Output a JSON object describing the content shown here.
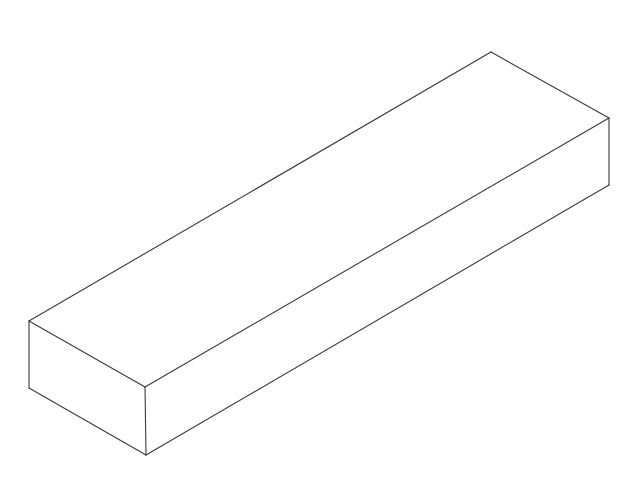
{
  "diagram": {
    "type": "isometric-box",
    "background": "#ffffff",
    "stroke_color": "#3a3a3a",
    "vertices": {
      "top_back": [
        491,
        52
      ],
      "right_top": [
        609,
        118
      ],
      "right_bottom": [
        609,
        185
      ],
      "left_top": [
        29,
        321
      ],
      "left_bottom": [
        29,
        388
      ],
      "front_top": [
        145,
        387
      ],
      "front_bottom": [
        146,
        455
      ]
    },
    "edges": [
      {
        "name": "top-back-left-edge",
        "from": "left_top",
        "to": "top_back"
      },
      {
        "name": "top-back-right-edge",
        "from": "top_back",
        "to": "right_top"
      },
      {
        "name": "top-front-right-edge",
        "from": "front_top",
        "to": "right_top"
      },
      {
        "name": "top-front-left-edge",
        "from": "left_top",
        "to": "front_top"
      },
      {
        "name": "left-vertical-edge",
        "from": "left_top",
        "to": "left_bottom"
      },
      {
        "name": "front-vertical-edge",
        "from": "front_top",
        "to": "front_bottom"
      },
      {
        "name": "right-vertical-edge",
        "from": "right_top",
        "to": "right_bottom"
      },
      {
        "name": "bottom-left-edge",
        "from": "left_bottom",
        "to": "front_bottom"
      },
      {
        "name": "bottom-right-edge",
        "from": "front_bottom",
        "to": "right_bottom"
      }
    ]
  }
}
